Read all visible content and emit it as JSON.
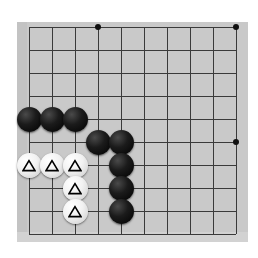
{
  "app": {
    "title": "Go Board Diagram",
    "board_size_label": "Partial board (corner diagram)"
  },
  "board": {
    "background_color": "#c9c9c9",
    "page_background_color": "#ffffff",
    "line_color": "#3a3a3a",
    "origin_x": 29,
    "origin_y": 27,
    "spacing": 23,
    "columns": 10,
    "rows": 10,
    "left": 17,
    "top": 22,
    "width": 231,
    "height": 220,
    "grid_visible": true
  },
  "star_points": [
    {
      "name": "star-point-d-top",
      "col": 4,
      "row": 1
    },
    {
      "name": "star-point-j-top",
      "col": 10,
      "row": 1
    },
    {
      "name": "star-point-j-mid",
      "col": 10,
      "row": 6
    }
  ],
  "stones": [
    {
      "id": "black-1",
      "color": "black",
      "col": 1,
      "row": 5,
      "marker": "none"
    },
    {
      "id": "black-2",
      "color": "black",
      "col": 2,
      "row": 5,
      "marker": "none"
    },
    {
      "id": "black-3",
      "color": "black",
      "col": 3,
      "row": 5,
      "marker": "none"
    },
    {
      "id": "black-4",
      "color": "black",
      "col": 4,
      "row": 6,
      "marker": "none"
    },
    {
      "id": "black-5",
      "color": "black",
      "col": 5,
      "row": 6,
      "marker": "none"
    },
    {
      "id": "black-6",
      "color": "black",
      "col": 5,
      "row": 7,
      "marker": "none"
    },
    {
      "id": "black-7",
      "color": "black",
      "col": 5,
      "row": 8,
      "marker": "none"
    },
    {
      "id": "black-8",
      "color": "black",
      "col": 5,
      "row": 9,
      "marker": "none"
    },
    {
      "id": "white-1",
      "color": "white",
      "col": 1,
      "row": 7,
      "marker": "triangle"
    },
    {
      "id": "white-2",
      "color": "white",
      "col": 2,
      "row": 7,
      "marker": "triangle"
    },
    {
      "id": "white-3",
      "color": "white",
      "col": 3,
      "row": 7,
      "marker": "triangle"
    },
    {
      "id": "white-4",
      "color": "white",
      "col": 3,
      "row": 8,
      "marker": "triangle"
    },
    {
      "id": "white-5",
      "color": "white",
      "col": 3,
      "row": 9,
      "marker": "triangle"
    }
  ],
  "stone_style": {
    "diameter": 25,
    "black_fill": "#121212",
    "white_fill": "#f4f4f4",
    "marker_stroke": "#000000",
    "marker_glyph": "triangle"
  },
  "counts": {
    "black_stones": 8,
    "white_stones": 5,
    "marked_stones": 5
  }
}
